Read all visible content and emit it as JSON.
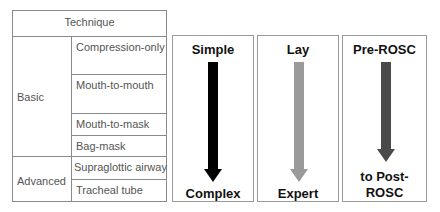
{
  "table": {
    "header": "Technique",
    "groups": [
      {
        "label": "Basic",
        "items": [
          "Compression-only",
          "Mouth-to-mouth",
          "Mouth-to-mask",
          "Bag-mask"
        ]
      },
      {
        "label": "Advanced",
        "items": [
          "Supraglottic airway",
          "Tracheal tube"
        ]
      }
    ]
  },
  "panels": [
    {
      "top": "Simple",
      "bottom": "Complex",
      "arrow_color": "#000000"
    },
    {
      "top": "Lay",
      "bottom": "Expert",
      "arrow_color": "#9a9a9a"
    },
    {
      "top": "Pre-ROSC",
      "bottom_line1": "to Post-",
      "bottom_line2": "ROSC",
      "arrow_color": "#4a4a4a"
    }
  ]
}
